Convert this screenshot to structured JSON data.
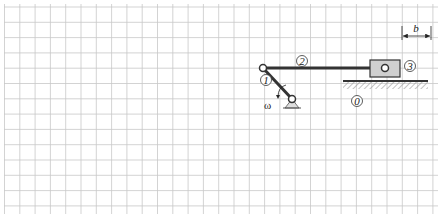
{
  "diagram": {
    "type": "slider-crank mechanism on grid",
    "grid": {
      "spacing_px": 15.3,
      "color": "#c8c8c8"
    },
    "links": [
      {
        "id": "1",
        "label": "1",
        "name": "crank"
      },
      {
        "id": "2",
        "label": "2",
        "name": "connecting-rod"
      },
      {
        "id": "3",
        "label": "3",
        "name": "slider"
      },
      {
        "id": "0",
        "label": "0",
        "name": "ground"
      }
    ],
    "angular_velocity_label": "ω",
    "dimension_label": "b",
    "colors": {
      "link": "#333333",
      "slider_fill": "#cfcfcf",
      "hatch": "#999999"
    }
  }
}
